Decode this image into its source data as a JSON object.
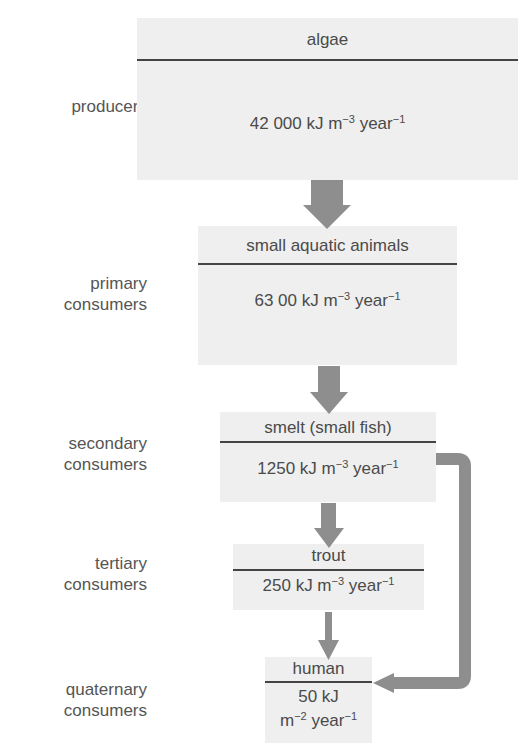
{
  "levels": [
    {
      "label_line1": "producers",
      "label_line2": ""
    },
    {
      "label_line1": "primary",
      "label_line2": "consumers"
    },
    {
      "label_line1": "secondary",
      "label_line2": "consumers"
    },
    {
      "label_line1": "tertiary",
      "label_line2": "consumers"
    },
    {
      "label_line1": "quaternary",
      "label_line2": "consumers"
    }
  ],
  "boxes": [
    {
      "name": "algae",
      "value_num": "42 000 kJ m",
      "exp1": "−3",
      "unit2": " year",
      "exp2": "−1"
    },
    {
      "name": "small aquatic animals",
      "value_num": "63 00 kJ m",
      "exp1": "−3",
      "unit2": " year",
      "exp2": "−1"
    },
    {
      "name": "smelt (small fish)",
      "value_num": "1250 kJ m",
      "exp1": "−3",
      "unit2": " year",
      "exp2": "−1"
    },
    {
      "name": "trout",
      "value_num": "250 kJ m",
      "exp1": "−3",
      "unit2": " year",
      "exp2": "−1"
    },
    {
      "name": "human",
      "value_line1": "50 kJ",
      "value_num": "m",
      "exp1": "−2",
      "unit2": " year",
      "exp2": "−1"
    }
  ],
  "colors": {
    "box_fill": "#efefef",
    "arrow": "#8e8e8e",
    "divider": "#444444",
    "text": "#4a4a4a"
  },
  "arrows": [
    {
      "from": "algae",
      "to": "small aquatic animals"
    },
    {
      "from": "small aquatic animals",
      "to": "smelt (small fish)"
    },
    {
      "from": "smelt (small fish)",
      "to": "trout"
    },
    {
      "from": "trout",
      "to": "human"
    },
    {
      "from": "smelt (small fish)",
      "to": "human",
      "style": "bent"
    }
  ]
}
